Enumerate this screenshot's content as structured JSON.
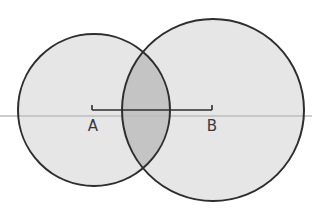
{
  "diagram": {
    "type": "two-circle-overlap",
    "background_color": "#ffffff",
    "circle_fill_color": "#e6e6e6",
    "overlap_fill_color": "#c4c4c4",
    "stroke_color": "#2e2e2e",
    "axis_line_color": "#bdbdbd",
    "circles": [
      {
        "id": "A",
        "cx": 94,
        "cy": 110,
        "r": 76
      },
      {
        "id": "B",
        "cx": 213,
        "cy": 110,
        "r": 91
      }
    ],
    "axis_line": {
      "y": 116,
      "x1": 0,
      "x2": 312
    },
    "segment": {
      "from": "A",
      "to": "B",
      "y": 110,
      "x1": 92,
      "x2": 212,
      "tick_height": 5
    },
    "labels": {
      "a": {
        "text": "A",
        "x": 93,
        "y": 131
      },
      "b": {
        "text": "B",
        "x": 212,
        "y": 131
      }
    }
  }
}
